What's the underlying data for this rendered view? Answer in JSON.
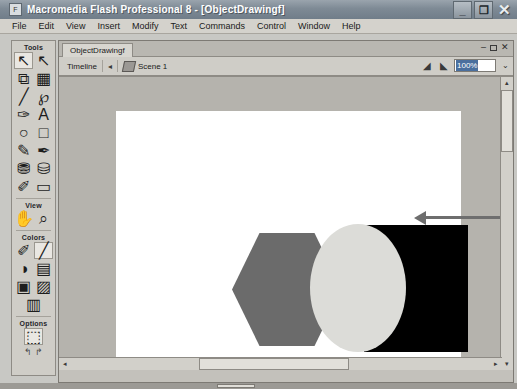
{
  "window": {
    "title": "Macromedia Flash Professional 8 - [ObjectDrawingf]",
    "app_icon": "flash-app-icon",
    "controls": {
      "minimize": "_",
      "restore": "❐",
      "close": "✕"
    }
  },
  "menubar": {
    "items": [
      "File",
      "Edit",
      "View",
      "Insert",
      "Modify",
      "Text",
      "Commands",
      "Control",
      "Window",
      "Help"
    ]
  },
  "tools_panel": {
    "sections": [
      {
        "label": "Tools",
        "tools": [
          {
            "name": "selection-tool",
            "glyph": "↖",
            "selected": true
          },
          {
            "name": "subselection-tool",
            "glyph": "↖",
            "selected": false
          },
          {
            "name": "free-transform-tool",
            "glyph": "⧉",
            "selected": false
          },
          {
            "name": "gradient-transform-tool",
            "glyph": "▦",
            "selected": false
          },
          {
            "name": "line-tool",
            "glyph": "╱",
            "selected": false
          },
          {
            "name": "lasso-tool",
            "glyph": "℘",
            "selected": false
          },
          {
            "name": "pen-tool",
            "glyph": "✑",
            "selected": false
          },
          {
            "name": "text-tool",
            "glyph": "A",
            "selected": false
          },
          {
            "name": "oval-tool",
            "glyph": "○",
            "selected": false
          },
          {
            "name": "rectangle-tool",
            "glyph": "□",
            "selected": false
          },
          {
            "name": "pencil-tool",
            "glyph": "✎",
            "selected": false
          },
          {
            "name": "brush-tool",
            "glyph": "✒",
            "selected": false
          },
          {
            "name": "ink-bottle-tool",
            "glyph": "⛃",
            "selected": false
          },
          {
            "name": "paint-bucket-tool",
            "glyph": "⛁",
            "selected": false
          },
          {
            "name": "eyedropper-tool",
            "glyph": "✐",
            "selected": false
          },
          {
            "name": "eraser-tool",
            "glyph": "▭",
            "selected": false
          }
        ]
      },
      {
        "label": "View",
        "tools": [
          {
            "name": "hand-tool",
            "glyph": "✋",
            "selected": false
          },
          {
            "name": "zoom-tool",
            "glyph": "⌕",
            "selected": false
          }
        ]
      },
      {
        "label": "Colors",
        "tools": [
          {
            "name": "stroke-color-swatch",
            "glyph": "✐",
            "selected": false
          },
          {
            "name": "fill-color-swatch",
            "glyph": "╱",
            "selected": true
          },
          {
            "name": "black-and-white-button",
            "glyph": "◑",
            "selected": false
          },
          {
            "name": "swap-colors-button",
            "glyph": "▤",
            "selected": false
          },
          {
            "name": "no-color-button",
            "glyph": "▣",
            "selected": false
          },
          {
            "name": "color-picker-button",
            "glyph": "▨",
            "selected": false
          },
          {
            "name": "gradient-button",
            "glyph": "▥",
            "selected": false
          }
        ]
      },
      {
        "label": "Options",
        "tools": [
          {
            "name": "object-drawing-toggle",
            "glyph": "⬚",
            "selected": true
          }
        ],
        "extra_glyphs": [
          "↰",
          "↱"
        ]
      }
    ]
  },
  "document": {
    "tab_label": "ObjectDrawingf",
    "window_controls": {
      "minimize": "–",
      "restore": "□",
      "close": "✕"
    },
    "timeline": {
      "label": "Timeline",
      "collapse_arrow": "◂",
      "scene_icon": "scene-icon",
      "scene_label": "Scene 1",
      "edit_scene_icon": "edit-scene-icon",
      "edit_symbol_icon": "edit-symbol-icon",
      "zoom_value": "100%",
      "zoom_caret": "⌄"
    }
  },
  "canvas": {
    "shapes": [
      {
        "name": "hexagon-shape",
        "type": "hexagon",
        "color": "#6b6b6b",
        "x": 116,
        "y": 122,
        "width": 110,
        "height": 113
      },
      {
        "name": "black-rectangle-shape",
        "type": "rectangle",
        "color": "#000000",
        "x": 248,
        "y": 114,
        "width": 104,
        "height": 127
      },
      {
        "name": "light-circle-shape",
        "type": "circle",
        "color": "#dcdcd8",
        "x": 194,
        "y": 113,
        "width": 96,
        "height": 128
      }
    ],
    "annotation": {
      "name": "pointer-annotation",
      "arrow_color": "#6e6e6e",
      "dot_color": "#5e5e5e"
    }
  },
  "scrollbars": {
    "vertical": {
      "up_arrow": "▴",
      "down_arrow": "▾"
    },
    "horizontal": {
      "left_arrow": "◂",
      "right_arrow": "▸"
    }
  }
}
